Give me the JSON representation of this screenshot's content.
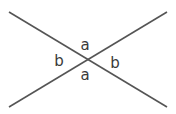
{
  "diagram": {
    "type": "intersecting-lines",
    "line_color": "#555555",
    "label_color": "#3a3a3a",
    "lines": [
      {
        "name": "line-1",
        "x1": 9,
        "y1": 12,
        "x2": 167,
        "y2": 107
      },
      {
        "name": "line-2",
        "x1": 9,
        "y1": 107,
        "x2": 167,
        "y2": 12
      }
    ],
    "intersection": {
      "x": 88,
      "y": 59
    },
    "labels": [
      {
        "name": "angle-top",
        "text": "a",
        "x": 85,
        "y": 50
      },
      {
        "name": "angle-left",
        "text": "b",
        "x": 59,
        "y": 66
      },
      {
        "name": "angle-right",
        "text": "b",
        "x": 115,
        "y": 68
      },
      {
        "name": "angle-bottom",
        "text": "a",
        "x": 85,
        "y": 80
      }
    ]
  }
}
